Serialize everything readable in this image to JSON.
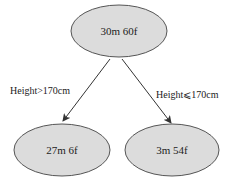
{
  "diagram": {
    "type": "decision-tree",
    "root": {
      "label": "30m 60f"
    },
    "children": [
      {
        "label": "27m 6f",
        "edge_label": "Height>170cm"
      },
      {
        "label": "3m 54f",
        "edge_label": "Height⩽170cm"
      }
    ],
    "colors": {
      "node_fill": "#dcdcdc",
      "node_stroke": "#555555",
      "edge": "#333333",
      "text": "#222222"
    }
  }
}
